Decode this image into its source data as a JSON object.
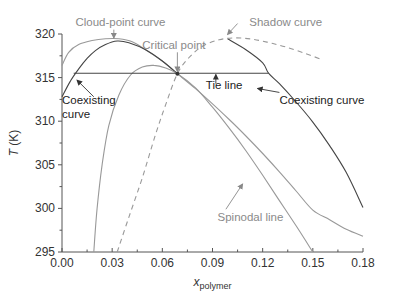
{
  "chart_data": {
    "type": "line",
    "title": "",
    "xlabel": "x",
    "xlabel_sub": "polymer",
    "ylabel_italic": "T",
    "ylabel_unit": " (K)",
    "xlim": [
      0,
      0.18
    ],
    "ylim": [
      295,
      320
    ],
    "x_ticks": [
      0.0,
      0.03,
      0.06,
      0.09,
      0.12,
      0.15,
      0.18
    ],
    "x_tick_labels": [
      "0.00",
      "0.03",
      "0.06",
      "0.09",
      "0.12",
      "0.15",
      "0.18"
    ],
    "y_ticks": [
      295,
      300,
      305,
      310,
      315,
      320
    ],
    "y_tick_labels": [
      "295",
      "300",
      "305",
      "310",
      "315",
      "320"
    ],
    "grid": false,
    "colors": {
      "dark": "#444444",
      "grey": "#999999",
      "axis": "#555555"
    },
    "series": [
      {
        "name": "Cloud-point curve",
        "style": "solid",
        "color": "grey",
        "points": [
          [
            0.0,
            316.4
          ],
          [
            0.004,
            317.9
          ],
          [
            0.01,
            318.8
          ],
          [
            0.018,
            319.25
          ],
          [
            0.026,
            319.45
          ],
          [
            0.034,
            319.45
          ],
          [
            0.042,
            319.1
          ],
          [
            0.05,
            318.2
          ],
          [
            0.06,
            316.9
          ],
          [
            0.069,
            315.45
          ],
          [
            0.08,
            313.7
          ],
          [
            0.09,
            312.0
          ],
          [
            0.1,
            310.2
          ],
          [
            0.11,
            308.3
          ],
          [
            0.12,
            306.3
          ],
          [
            0.13,
            304.2
          ],
          [
            0.14,
            302.0
          ],
          [
            0.15,
            299.8
          ],
          [
            0.16,
            298.7
          ],
          [
            0.17,
            297.6
          ],
          [
            0.18,
            296.8
          ]
        ]
      },
      {
        "name": "Coexisting curve (left branch)",
        "style": "solid",
        "color": "dark",
        "points": [
          [
            0.0,
            312.8
          ],
          [
            0.005,
            314.6
          ],
          [
            0.01,
            316.0
          ],
          [
            0.015,
            317.2
          ],
          [
            0.02,
            318.1
          ],
          [
            0.026,
            318.8
          ],
          [
            0.033,
            319.2
          ],
          [
            0.04,
            319.0
          ],
          [
            0.05,
            318.2
          ],
          [
            0.06,
            316.9
          ],
          [
            0.069,
            315.45
          ]
        ]
      },
      {
        "name": "Coexisting curve (right branch)",
        "style": "solid",
        "color": "dark",
        "points": [
          [
            0.099,
            319.45
          ],
          [
            0.11,
            318.2
          ],
          [
            0.12,
            316.7
          ],
          [
            0.1235,
            315.5
          ],
          [
            0.13,
            314.3
          ],
          [
            0.14,
            312.2
          ],
          [
            0.15,
            309.9
          ],
          [
            0.16,
            307.2
          ],
          [
            0.17,
            304.1
          ],
          [
            0.18,
            300.1
          ]
        ]
      },
      {
        "name": "Shadow curve",
        "style": "dashed",
        "color": "grey",
        "points": [
          [
            0.033,
            295.0
          ],
          [
            0.04,
            299.0
          ],
          [
            0.048,
            303.5
          ],
          [
            0.056,
            308.5
          ],
          [
            0.062,
            311.9
          ],
          [
            0.069,
            315.45
          ],
          [
            0.076,
            317.3
          ],
          [
            0.084,
            318.6
          ],
          [
            0.094,
            319.35
          ],
          [
            0.104,
            319.55
          ],
          [
            0.114,
            319.4
          ],
          [
            0.124,
            319.0
          ],
          [
            0.134,
            318.5
          ],
          [
            0.145,
            317.8
          ],
          [
            0.155,
            317.1
          ]
        ]
      },
      {
        "name": "Spinodal line",
        "style": "solid",
        "color": "grey",
        "points": [
          [
            0.019,
            295.0
          ],
          [
            0.021,
            300.0
          ],
          [
            0.024,
            305.0
          ],
          [
            0.028,
            309.5
          ],
          [
            0.034,
            313.0
          ],
          [
            0.041,
            315.3
          ],
          [
            0.048,
            316.2
          ],
          [
            0.055,
            316.4
          ],
          [
            0.062,
            316.1
          ],
          [
            0.069,
            315.45
          ],
          [
            0.08,
            313.8
          ],
          [
            0.09,
            311.6
          ],
          [
            0.1,
            309.2
          ],
          [
            0.11,
            306.6
          ],
          [
            0.12,
            303.8
          ],
          [
            0.13,
            300.9
          ],
          [
            0.14,
            298.0
          ],
          [
            0.15,
            295.0
          ]
        ]
      },
      {
        "name": "Tie line",
        "style": "solid",
        "color": "dark",
        "points": [
          [
            0.007,
            315.5
          ],
          [
            0.1235,
            315.5
          ]
        ]
      }
    ],
    "critical_point": {
      "x": 0.069,
      "y": 315.45
    },
    "annotations": [
      {
        "text": "Cloud-point curve",
        "tone": "grey",
        "text_at": [
          0.008,
          320.9
        ],
        "arrow_from": [
          0.031,
          320.5
        ],
        "arrow_to": [
          0.031,
          319.55
        ]
      },
      {
        "text": "Critical point",
        "tone": "grey",
        "text_at": [
          0.048,
          318.3
        ],
        "arrow_from": [
          0.069,
          317.9
        ],
        "arrow_to": [
          0.069,
          315.7
        ]
      },
      {
        "text": "Shadow curve",
        "tone": "grey",
        "text_at": [
          0.112,
          320.9
        ],
        "arrow_from": [
          0.105,
          321.2
        ],
        "arrow_to": [
          0.099,
          319.95
        ]
      },
      {
        "text": "Tie line",
        "tone": "dark",
        "text_at": [
          0.086,
          313.7
        ],
        "arrow_from": [
          0.092,
          314.3
        ],
        "arrow_to": [
          0.092,
          315.35
        ]
      },
      {
        "text": "Coexisting curve",
        "tone": "dark",
        "text_at": [
          0.13,
          312.0
        ],
        "arrow_from": [
          0.13,
          313.3
        ],
        "arrow_to": [
          0.117,
          313.75
        ]
      },
      {
        "text": "Coexisting",
        "tone": "dark",
        "text_at": [
          0.0,
          312.0
        ],
        "arrow_from": [
          0.019,
          312.8
        ],
        "arrow_to": [
          0.009,
          314.7
        ]
      },
      {
        "text": "curve",
        "tone": "dark",
        "text_at": [
          0.0,
          310.4
        ],
        "arrow_from": null,
        "arrow_to": null
      },
      {
        "text": "Spinodal line",
        "tone": "grey",
        "text_at": [
          0.093,
          298.5
        ],
        "arrow_from": [
          0.098,
          299.9
        ],
        "arrow_to": [
          0.108,
          302.8
        ]
      }
    ]
  }
}
